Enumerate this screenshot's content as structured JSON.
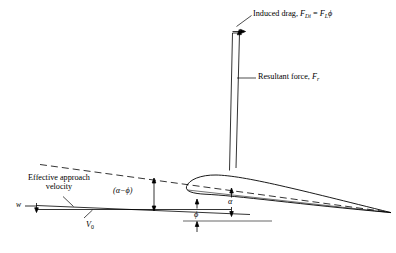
{
  "figure": {
    "type": "technical-diagram",
    "background_color": "#ffffff",
    "line_color": "#000000"
  },
  "labels": {
    "induced_drag": "Induced drag,",
    "induced_drag_symbol_f": "F",
    "induced_drag_symbol_sub": "Di",
    "induced_drag_equals": " = ",
    "induced_drag_rhs_f": "F",
    "induced_drag_rhs_sub": "L",
    "induced_drag_rhs_phi": "ϕ",
    "resultant_force": "Resultant force,",
    "resultant_force_symbol": "F",
    "resultant_force_sub": "r",
    "effective_approach_line1": "Effective approach",
    "effective_approach_line2": "velocity",
    "w": "w",
    "v0_symbol": "V",
    "v0_sub": "0",
    "alpha_minus_phi": "(α−ϕ)",
    "phi": "ϕ",
    "alpha": "α"
  },
  "geometry": {
    "resultant_vector": {
      "x_top": 238,
      "y_top": 31,
      "x_bottom": 233,
      "y_bottom": 170
    },
    "induced_drag_arrow": {
      "x_start": 232,
      "y": 31,
      "x_end": 246
    },
    "airfoil": {
      "leading_edge_x": 185,
      "leading_edge_y": 186,
      "trailing_edge_x": 391,
      "trailing_edge_y": 213
    },
    "chord_dashed_line": {
      "x1": 40,
      "y1": 165,
      "x2": 388,
      "y2": 213
    },
    "approach_line": {
      "x1": 33,
      "y1": 207,
      "x2": 230,
      "y2": 207
    },
    "phi_reference_line": {
      "x1": 183,
      "y1": 221,
      "x2": 272,
      "y2": 221
    }
  }
}
